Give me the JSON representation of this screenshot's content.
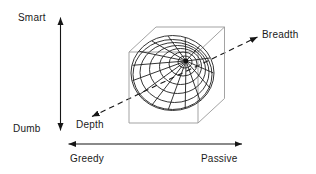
{
  "diagram": {
    "vertical_axis": {
      "top": "Smart",
      "bottom": "Dumb"
    },
    "horizontal_axis": {
      "left": "Greedy",
      "right": "Passive"
    },
    "diagonal_axis": {
      "lower": "Depth",
      "upper": "Breadth"
    },
    "colors": {
      "axis_line": "#161616",
      "sphere_line": "#1f1f1f",
      "cube_line": "#999999",
      "text": "#1a1a1a",
      "background": "#ffffff"
    }
  }
}
